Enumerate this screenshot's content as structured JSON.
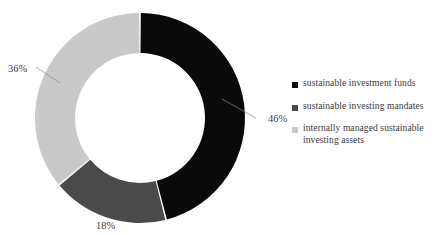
{
  "chart_data": {
    "type": "pie",
    "variant": "donut",
    "title": "",
    "subtitle": "",
    "xlabel": "",
    "ylabel": "",
    "grid": false,
    "legend_position": "right",
    "start_angle_deg": 0,
    "direction": "clockwise",
    "categories": [
      "sustainable investment funds",
      "sustainable investing mandates",
      "internally managed sustainable investing assets"
    ],
    "values": [
      46,
      18,
      36
    ],
    "value_labels": [
      "46%",
      "18%",
      "36%"
    ],
    "colors": [
      "#0a0a0a",
      "#4a4a4a",
      "#c9c9c9"
    ],
    "units": "percent",
    "total": 100
  },
  "chart": {
    "background_color": "#ffffff",
    "center_x": 140,
    "center_y": 118,
    "outer_radius": 105,
    "inner_radius": 65,
    "slices": [
      {
        "name": "sustainable investment funds",
        "value": 46,
        "label": "46%",
        "color": "#0a0a0a",
        "label_x": 268,
        "label_y": 122,
        "leader_from_x": 222,
        "leader_from_y": 99,
        "leader_to_x": 256,
        "leader_to_y": 118
      },
      {
        "name": "sustainable investing mandates",
        "value": 18,
        "label": "18%",
        "color": "#4a4a4a",
        "label_x": 96,
        "label_y": 229,
        "leader_from_x": 0,
        "leader_from_y": 0,
        "leader_to_x": 0,
        "leader_to_y": 0
      },
      {
        "name": "internally managed sustainable investing assets",
        "value": 36,
        "label": "36%",
        "color": "#c9c9c9",
        "label_x": 8,
        "label_y": 72,
        "leader_from_x": 60,
        "leader_from_y": 83,
        "leader_to_x": 36,
        "leader_to_y": 67
      }
    ]
  },
  "legend": {
    "items": [
      {
        "label": "sustainable investment funds",
        "color": "#0a0a0a",
        "marker": "square-marker"
      },
      {
        "label": "sustainable investing mandates",
        "color": "#4a4a4a",
        "marker": "square-marker"
      },
      {
        "label": "internally managed sustainable investing assets",
        "color": "#c9c9c9",
        "marker": "square-marker"
      }
    ]
  }
}
